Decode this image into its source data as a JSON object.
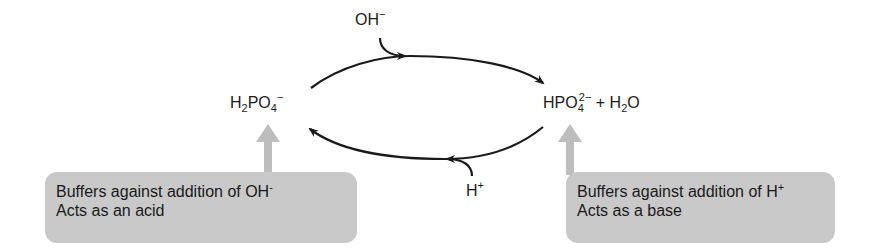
{
  "diagram": {
    "type": "phosphate buffer equilibrium cycle",
    "species_left": {
      "base": "H",
      "sub1": "2",
      "mid": "PO",
      "sub2": "4",
      "charge": "−"
    },
    "species_right": {
      "base": "HPO",
      "sub1": "4",
      "charge": "2−",
      "plus": " + H",
      "sub2": "2",
      "tail": "O"
    },
    "reagent_top": {
      "text": "OH",
      "charge": "−"
    },
    "reagent_bottom": {
      "text": "H",
      "charge": "+"
    },
    "left_box": {
      "line1": "Buffers against addition of OH",
      "line1_charge": "-",
      "line2": "Acts as an acid"
    },
    "right_box": {
      "line1": "Buffers against addition of H",
      "line1_charge": "+",
      "line2": "Acts as a base"
    },
    "colors": {
      "arrow": "#1a1a1a",
      "box_fill": "#c9c9c9",
      "block_arrow": "#bdbdbd"
    }
  }
}
